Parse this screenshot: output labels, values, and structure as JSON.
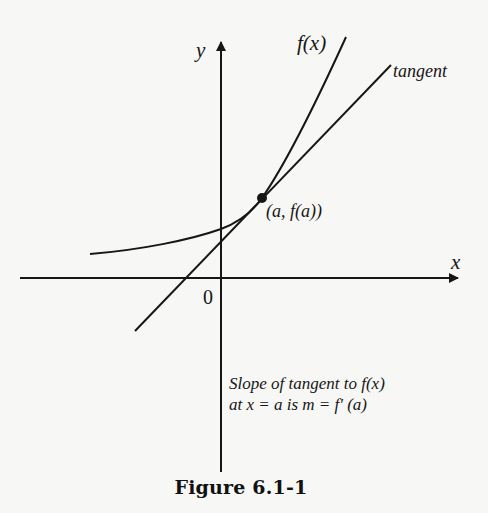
{
  "figure": {
    "caption": "Figure 6.1-1",
    "axes": {
      "x_label": "x",
      "y_label": "y",
      "origin_label": "0"
    },
    "curve": {
      "label": "f(x)",
      "description": "increasing, concave-up exponential-like curve"
    },
    "tangent": {
      "label": "tangent",
      "point_label": "(a, f(a))"
    },
    "annotation": {
      "line1": "Slope of tangent to f(x)",
      "line2": "at x = a is m = f' (a)"
    },
    "colors": {
      "ink": "#161616",
      "background": "#f7f7f5"
    }
  }
}
